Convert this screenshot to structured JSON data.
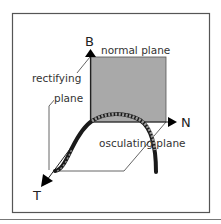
{
  "diagram": {
    "axes": {
      "binormal": {
        "label": "B"
      },
      "normal": {
        "label": "N"
      },
      "tangent": {
        "label": "T"
      }
    },
    "planes": {
      "normal_plane": {
        "label": "normal plane",
        "fill": "#a9a9a9"
      },
      "rectifying_plane": {
        "label_line1": "rectifying",
        "label_line2": "plane"
      },
      "osculating_plane": {
        "label": "osculating plane"
      }
    },
    "curve": {
      "description": "space curve passing through origin",
      "color": "#1a1a1a",
      "highlight_color": "#9a9a9a"
    },
    "colors": {
      "frame": "#555555",
      "lines": "#444444",
      "arrows": "#000000"
    }
  }
}
